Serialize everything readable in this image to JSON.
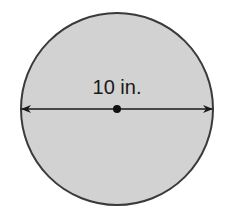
{
  "diagram": {
    "shape": "circle",
    "measurement": "diameter",
    "label": "10 in.",
    "colors": {
      "fill": "#d2d2d2",
      "stroke": "#3a3a3a",
      "line": "#1a1a1a"
    }
  }
}
